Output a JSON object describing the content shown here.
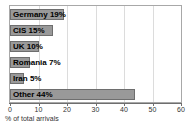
{
  "chart_data": {
    "type": "bar",
    "orientation": "horizontal",
    "title": "",
    "xlabel": "% of total arrivals",
    "ylabel": "",
    "xlim": [
      0,
      60
    ],
    "xticks": [
      0,
      10,
      20,
      30,
      40,
      50,
      60
    ],
    "grid": true,
    "legend": false,
    "categories": [
      "Germany",
      "CIS",
      "UK",
      "Romania",
      "Iran",
      "Other"
    ],
    "values": [
      19,
      15,
      10,
      7,
      5,
      44
    ],
    "data_labels": [
      "Germany 19%",
      "CIS 15%",
      "UK 10%",
      "Romania 7%",
      "Iran 5%",
      "Other 44%"
    ],
    "bar_color": "#999999",
    "bar_edge_color": "#6e6e6e",
    "grid_color": "#dcdcdc",
    "plot_border_color": "#a8a8a8"
  },
  "axis": {
    "tick_labels": [
      "0",
      "10",
      "20",
      "30",
      "40",
      "50",
      "60"
    ],
    "title": "% of total arrivals"
  }
}
